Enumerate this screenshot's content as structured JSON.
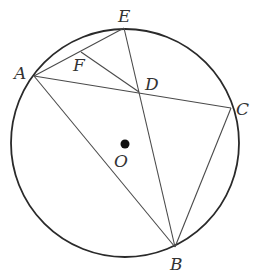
{
  "diagram": {
    "circle": {
      "center": "O",
      "cx": 125,
      "cy": 143,
      "r": 114,
      "stroke": "#2a2a2a"
    },
    "points": {
      "A": {
        "x": 34,
        "y": 76,
        "label": "A",
        "lx": 14,
        "ly": 79
      },
      "E": {
        "x": 124,
        "y": 28,
        "label": "E",
        "lx": 118,
        "ly": 22
      },
      "C": {
        "x": 231,
        "y": 108,
        "label": "C",
        "lx": 236,
        "ly": 115
      },
      "B": {
        "x": 175,
        "y": 247,
        "label": "B",
        "lx": 170,
        "ly": 270
      },
      "D": {
        "x": 139,
        "y": 92,
        "label": "D",
        "lx": 145,
        "ly": 90
      },
      "F": {
        "x": 81,
        "y": 52,
        "label": "F",
        "lx": 73,
        "ly": 71
      },
      "O": {
        "x": 125,
        "y": 144,
        "label": "O",
        "lx": 114,
        "ly": 167
      }
    },
    "segments": [
      [
        "A",
        "E"
      ],
      [
        "A",
        "C"
      ],
      [
        "A",
        "B"
      ],
      [
        "E",
        "B"
      ],
      [
        "C",
        "B"
      ],
      [
        "F",
        "D"
      ]
    ],
    "line_color": "#4a4a4a"
  }
}
